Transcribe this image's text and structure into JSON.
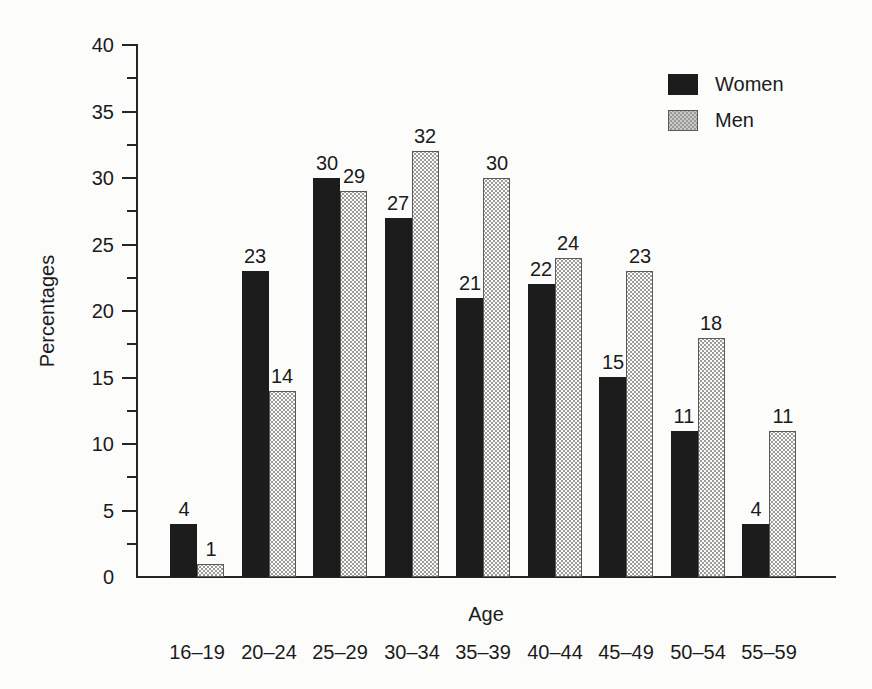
{
  "figure": {
    "background_color": "#fcfcfb",
    "text_color": "#1b1b1b",
    "axis_color": "#262626"
  },
  "chart_data": {
    "type": "bar",
    "title": "",
    "xlabel": "Age",
    "ylabel": "Percentages",
    "categories": [
      "16–19",
      "20–24",
      "25–29",
      "30–34",
      "35–39",
      "40–44",
      "45–49",
      "50–54",
      "55–59"
    ],
    "series": [
      {
        "name": "Women",
        "color": "#1c1c1c",
        "fill_style": "solid-black",
        "values": [
          4,
          23,
          30,
          27,
          21,
          22,
          15,
          11,
          4
        ]
      },
      {
        "name": "Men",
        "color": "#c9c8c4",
        "fill_style": "halftone-gray",
        "values": [
          1,
          14,
          29,
          32,
          30,
          24,
          23,
          18,
          11
        ]
      }
    ],
    "ylim": [
      0,
      40
    ],
    "ytick_labels": [
      0,
      5,
      10,
      15,
      20,
      25,
      30,
      35,
      40
    ],
    "ytick_major_step": 5,
    "ytick_minor_step": 2.5,
    "grid": "off",
    "legend_position": "top-right",
    "bar_value_labels": "above"
  }
}
